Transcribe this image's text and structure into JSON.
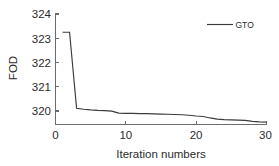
{
  "chart_data": {
    "type": "line",
    "title": "",
    "xlabel": "Iteration numbers",
    "ylabel": "FOD",
    "xlim": [
      0,
      30
    ],
    "ylim": [
      319.45,
      324
    ],
    "xticks": [
      0,
      10,
      20,
      30
    ],
    "xtick_labels": [
      "0",
      "10",
      "20",
      "30"
    ],
    "yticks": [
      320,
      321,
      322,
      323,
      324
    ],
    "ytick_labels": [
      "320",
      "321",
      "322",
      "323",
      "324"
    ],
    "grid": false,
    "legend_position": "top-right",
    "line_color": "#3a3a3a",
    "axis_color": "#6b6b6b",
    "series": [
      {
        "name": "GTO",
        "x": [
          1,
          2,
          3,
          4,
          5,
          6,
          7,
          8,
          9,
          10,
          11,
          12,
          13,
          14,
          15,
          16,
          17,
          18,
          19,
          20,
          21,
          22,
          23,
          24,
          25,
          26,
          27,
          28,
          29,
          30
        ],
        "values": [
          323.25,
          323.25,
          320.12,
          320.08,
          320.05,
          320.03,
          320.02,
          320.0,
          319.92,
          319.91,
          319.91,
          319.9,
          319.9,
          319.89,
          319.88,
          319.87,
          319.86,
          319.85,
          319.83,
          319.8,
          319.78,
          319.72,
          319.67,
          319.65,
          319.64,
          319.63,
          319.62,
          319.58,
          319.56,
          319.55
        ]
      }
    ]
  },
  "legend": {
    "entries": [
      {
        "label": "GTO"
      }
    ]
  },
  "axes": {
    "x_label": "Iteration numbers",
    "y_label": "FOD"
  }
}
